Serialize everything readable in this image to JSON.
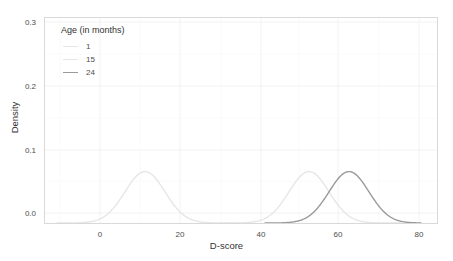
{
  "chart_data": {
    "type": "line",
    "title": "",
    "xlabel": "D-score",
    "ylabel": "Density",
    "xlim": [
      -12,
      86
    ],
    "ylim": [
      0.0,
      0.315
    ],
    "xticks": [
      0,
      20,
      40,
      60,
      80
    ],
    "xtick_labels": [
      "0",
      "20",
      "40",
      "60",
      "80"
    ],
    "yticks": [
      0.0,
      0.1,
      0.2,
      0.3
    ],
    "ytick_labels": [
      "0.0",
      "0.1",
      "0.2",
      "0.3"
    ],
    "grid": true,
    "legend_position": "top-left",
    "legend_title": "Age (in months)",
    "series": [
      {
        "name": "1",
        "color": "#e6e6e6",
        "distribution": "normal",
        "mean": 13,
        "sd": 5.0,
        "peak_density": 0.079,
        "x_range": [
          -9,
          36
        ],
        "x": [
          -9,
          -6,
          -3,
          0,
          3,
          5,
          7,
          9,
          11,
          13,
          15,
          17,
          19,
          21,
          23,
          25,
          28,
          31,
          34,
          36
        ],
        "y": [
          0.0,
          0.0,
          0.001,
          0.006,
          0.022,
          0.043,
          0.065,
          0.076,
          0.078,
          0.079,
          0.078,
          0.076,
          0.065,
          0.043,
          0.022,
          0.009,
          0.002,
          0.0,
          0.0,
          0.0
        ]
      },
      {
        "name": "15",
        "color": "#e6e6e6",
        "distribution": "normal",
        "mean": 54,
        "sd": 5.0,
        "peak_density": 0.079,
        "x_range": [
          32,
          77
        ],
        "x": [
          32,
          36,
          40,
          42,
          44,
          46,
          48,
          50,
          52,
          54,
          56,
          58,
          60,
          62,
          64,
          66,
          69,
          72,
          75,
          77
        ],
        "y": [
          0.0,
          0.0,
          0.002,
          0.006,
          0.014,
          0.027,
          0.045,
          0.062,
          0.074,
          0.079,
          0.074,
          0.062,
          0.045,
          0.027,
          0.014,
          0.006,
          0.001,
          0.0,
          0.0,
          0.0
        ]
      },
      {
        "name": "24",
        "color": "#9a9a9a",
        "distribution": "normal",
        "mean": 64,
        "sd": 5.0,
        "peak_density": 0.079,
        "x_range": [
          43,
          82
        ],
        "x": [
          43,
          46,
          49,
          52,
          54,
          56,
          58,
          60,
          62,
          64,
          66,
          68,
          70,
          72,
          74,
          76,
          78,
          80,
          82
        ],
        "y": [
          0.0,
          0.0,
          0.001,
          0.005,
          0.011,
          0.022,
          0.039,
          0.058,
          0.073,
          0.079,
          0.073,
          0.058,
          0.039,
          0.022,
          0.011,
          0.004,
          0.002,
          0.001,
          0.0
        ]
      }
    ]
  },
  "axis": {
    "xlabel": "D-score",
    "ylabel": "Density",
    "xtick_labels": [
      "0",
      "20",
      "40",
      "60",
      "80"
    ],
    "ytick_labels": [
      "0.0",
      "0.1",
      "0.2",
      "0.3"
    ]
  },
  "legend": {
    "title": "Age (in months)",
    "items": [
      {
        "label": "1",
        "color": "#e6e6e6"
      },
      {
        "label": "15",
        "color": "#e6e6e6"
      },
      {
        "label": "24",
        "color": "#9a9a9a"
      }
    ]
  },
  "colors": {
    "panel_border": "#d9d9d9",
    "grid_major": "#f2f2f2",
    "text": "#4d4d4d",
    "background": "#ffffff"
  }
}
